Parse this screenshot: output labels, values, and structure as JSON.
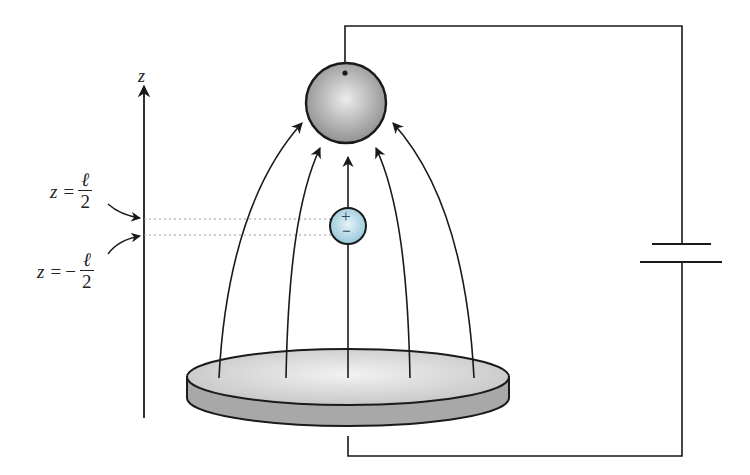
{
  "diagram": {
    "axis": {
      "label": "z"
    },
    "labels": {
      "upper": {
        "lhs": "z",
        "eq": "=",
        "sign": "",
        "num": "ℓ",
        "den": "2"
      },
      "lower": {
        "lhs": "z",
        "eq": "=",
        "sign": "−",
        "num": "ℓ",
        "den": "2"
      }
    },
    "dipole": {
      "plus": "+",
      "minus": "−",
      "color": "#a9d3e3"
    },
    "sphere": {
      "color": "#9a9a9a",
      "highlight": "#e6e6e6"
    },
    "disk": {
      "top_color": "#d8d8d8",
      "side_color": "#a8a8a8"
    },
    "battery": {
      "plates": 2
    },
    "field_lines": 5,
    "colors": {
      "stroke": "#1a1a1a",
      "dotted": "#999999"
    }
  }
}
